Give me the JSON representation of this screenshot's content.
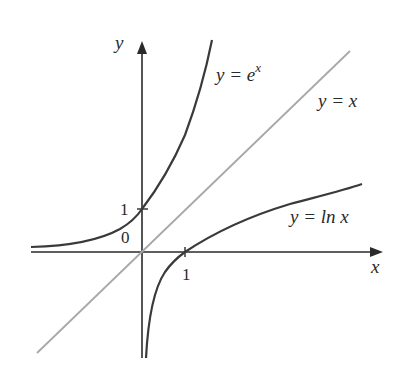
{
  "diagram": {
    "type": "function-graphs",
    "axes": {
      "x_label": "x",
      "y_label": "y",
      "origin_label": "0",
      "x_tick_label": "1",
      "y_tick_label": "1"
    },
    "curves": [
      {
        "name": "exp",
        "label_lhs": "y = e",
        "label_sup": "x",
        "color": "#3a3a3a"
      },
      {
        "name": "identity",
        "label": "y = x",
        "color": "#a8a8a8"
      },
      {
        "name": "ln",
        "label": "y = ln x",
        "color": "#3a3a3a"
      }
    ],
    "axis_color": "#2a2a2a"
  }
}
